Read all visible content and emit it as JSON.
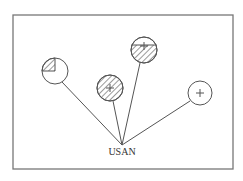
{
  "diagram": {
    "type": "hub-and-spoke",
    "hub": {
      "label": "USAN",
      "x": 122,
      "y": 145
    },
    "frame": {
      "x": 13,
      "y": 15,
      "width": 220,
      "height": 154,
      "stroke": "#777777"
    },
    "colors": {
      "stroke": "#555555",
      "hatch": "#555555",
      "background": "#ffffff"
    },
    "nodes": [
      {
        "id": "node-1",
        "cx": 55,
        "cy": 71,
        "r": 13,
        "fill": "quarter-hatched-upper-left",
        "symbol": "none"
      },
      {
        "id": "node-2",
        "cx": 110,
        "cy": 88,
        "r": 13,
        "fill": "fully-hatched",
        "symbol": "plus"
      },
      {
        "id": "node-3",
        "cx": 144,
        "cy": 50,
        "r": 13,
        "fill": "hatched-below-chord",
        "symbol": "plus"
      },
      {
        "id": "node-4",
        "cx": 200,
        "cy": 93,
        "r": 12,
        "fill": "empty",
        "symbol": "plus"
      }
    ]
  }
}
